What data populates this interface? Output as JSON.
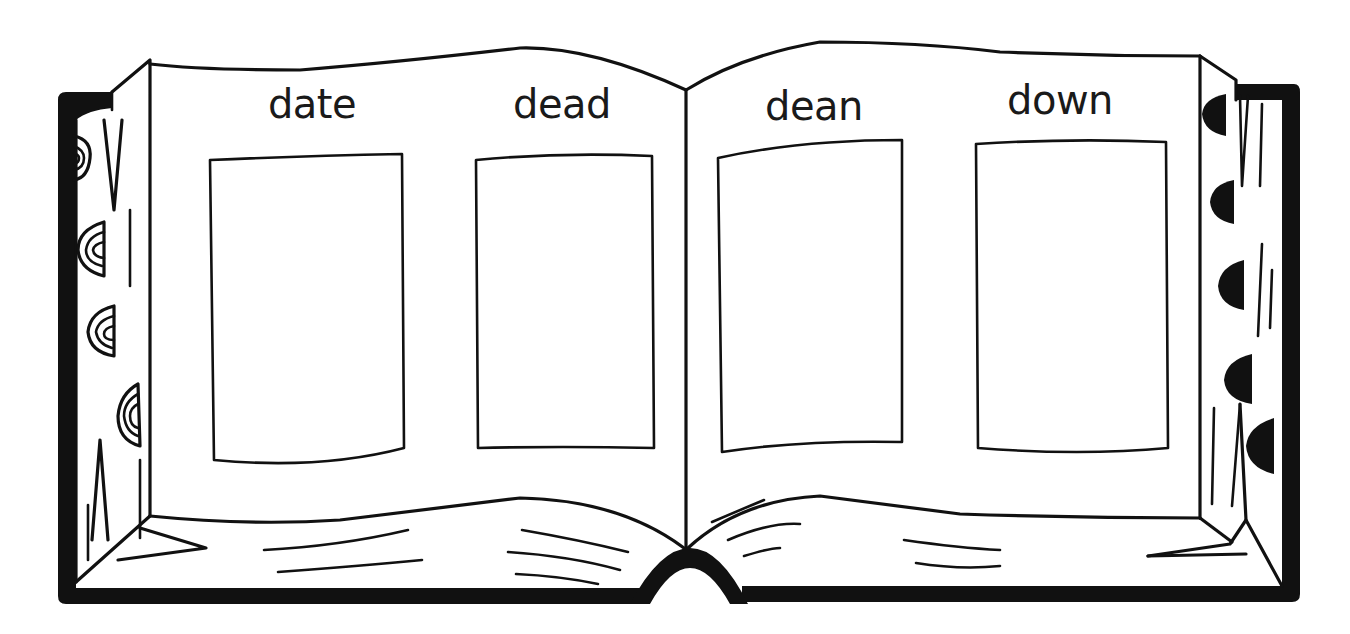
{
  "worksheet": {
    "words": [
      {
        "label": "date"
      },
      {
        "label": "dead"
      },
      {
        "label": "dean"
      },
      {
        "label": "down"
      }
    ],
    "picture_boxes": [
      {
        "for_word": "date",
        "content": ""
      },
      {
        "for_word": "dead",
        "content": ""
      },
      {
        "for_word": "dean",
        "content": ""
      },
      {
        "for_word": "down",
        "content": ""
      }
    ]
  },
  "colors": {
    "ink": "#111111",
    "paper": "#ffffff"
  }
}
